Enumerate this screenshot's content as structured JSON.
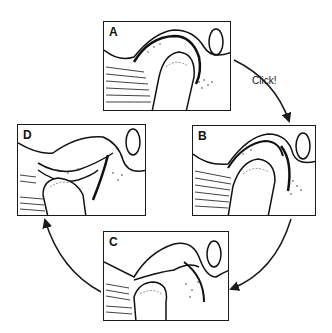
{
  "diagram": {
    "panels": [
      {
        "id": "A",
        "label": "A"
      },
      {
        "id": "B",
        "label": "B"
      },
      {
        "id": "C",
        "label": "C"
      },
      {
        "id": "D",
        "label": "D"
      }
    ],
    "arrows": [
      {
        "from": "A",
        "to": "B",
        "label": "Click!"
      },
      {
        "from": "B",
        "to": "C",
        "label": ""
      },
      {
        "from": "C",
        "to": "D",
        "label": ""
      }
    ],
    "click_label": "Click!",
    "stroke_color": "#1a1a1a",
    "background": "#ffffff"
  }
}
